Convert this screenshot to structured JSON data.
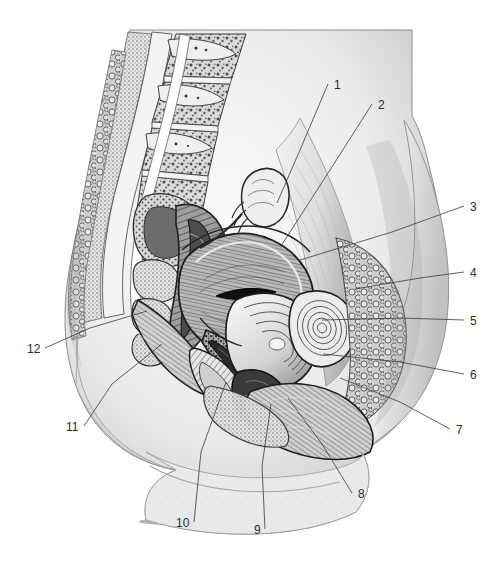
{
  "figure": {
    "type": "anatomical-illustration",
    "style": "grayscale engraving / halftone stipple",
    "background_color": "#ffffff",
    "ink_color": "#2b2b2b",
    "width": 503,
    "height": 568
  },
  "callouts": [
    {
      "id": "1",
      "text": "1",
      "label_x": 334,
      "label_y": 79,
      "tip_x": 277,
      "tip_y": 203,
      "bend_x": 300,
      "bend_y": 150
    },
    {
      "id": "2",
      "text": "2",
      "label_x": 378,
      "label_y": 99,
      "tip_x": 281,
      "tip_y": 246,
      "bend_x": 330,
      "bend_y": 170
    },
    {
      "id": "3",
      "text": "3",
      "label_x": 470,
      "label_y": 201,
      "tip_x": 300,
      "tip_y": 260,
      "bend_x": 392,
      "bend_y": 232
    },
    {
      "id": "4",
      "text": "4",
      "label_x": 470,
      "label_y": 267,
      "tip_x": 355,
      "tip_y": 289,
      "bend_x": 420,
      "bend_y": 278
    },
    {
      "id": "5",
      "text": "5",
      "label_x": 470,
      "label_y": 315,
      "tip_x": 322,
      "tip_y": 320,
      "bend_x": 400,
      "bend_y": 318
    },
    {
      "id": "6",
      "text": "6",
      "label_x": 470,
      "label_y": 369,
      "tip_x": 323,
      "tip_y": 354,
      "bend_x": 400,
      "bend_y": 362
    },
    {
      "id": "7",
      "text": "7",
      "label_x": 456,
      "label_y": 424,
      "tip_x": 340,
      "tip_y": 378,
      "bend_x": 400,
      "bend_y": 402
    },
    {
      "id": "8",
      "text": "8",
      "label_x": 358,
      "label_y": 488,
      "tip_x": 288,
      "tip_y": 398,
      "bend_x": 322,
      "bend_y": 444
    },
    {
      "id": "9",
      "text": "9",
      "label_x": 254,
      "label_y": 524,
      "tip_x": 271,
      "tip_y": 404,
      "bend_x": 262,
      "bend_y": 466
    },
    {
      "id": "10",
      "text": "10",
      "label_x": 176,
      "label_y": 517,
      "tip_x": 226,
      "tip_y": 382,
      "bend_x": 201,
      "bend_y": 452
    },
    {
      "id": "11",
      "text": "11",
      "label_x": 66,
      "label_y": 421,
      "tip_x": 162,
      "tip_y": 344,
      "bend_x": 112,
      "bend_y": 384
    },
    {
      "id": "12",
      "text": "12",
      "label_x": 27,
      "label_y": 343,
      "tip_x": 147,
      "tip_y": 311,
      "bend_x": 90,
      "bend_y": 328
    }
  ]
}
